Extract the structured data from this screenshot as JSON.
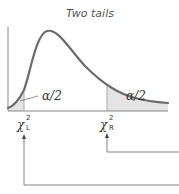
{
  "diagram": {
    "title": "Two tails",
    "distribution": "chi-square",
    "left_tail_label": "α/2",
    "right_tail_label": "α/2",
    "left_critical": {
      "symbol": "χ",
      "superscript": "2",
      "subscript": "L"
    },
    "right_critical": {
      "symbol": "χ",
      "superscript": "2",
      "subscript": "R"
    },
    "colors": {
      "curve": "#6b6b6b",
      "shading": "#e4e4e4",
      "axis": "#888888",
      "arrows": "#777777"
    }
  }
}
